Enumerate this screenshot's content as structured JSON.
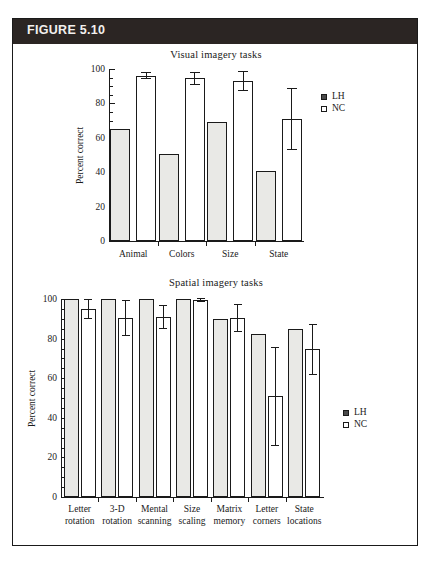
{
  "figure": {
    "label": "FIGURE 5.10",
    "header_color": "#2b2523",
    "frame_color": "#1a1a1a"
  },
  "legend": {
    "lh_label": "LH",
    "nc_label": "NC",
    "lh_swatch": "filled-square-icon",
    "nc_swatch": "open-square-icon",
    "lh_color": "#e9e9e6",
    "nc_color": "#ffffff"
  },
  "chart_data": [
    {
      "id": "visual",
      "type": "bar",
      "title": "Visual imagery tasks",
      "xlabel": "",
      "ylabel": "Percent correct",
      "ylim": [
        0,
        100
      ],
      "yticks": [
        0,
        20,
        40,
        60,
        80,
        100
      ],
      "ytick_labels": [
        "0",
        "20",
        "40",
        "60",
        "80",
        "100"
      ],
      "minor_tick_step": 5,
      "grid": false,
      "legend_position": "right",
      "categories": [
        "Animal",
        "Colors",
        "Size",
        "State"
      ],
      "series": [
        {
          "name": "LH",
          "values": [
            65,
            50.5,
            69,
            40.5
          ],
          "errors": [
            0,
            0,
            0,
            0
          ]
        },
        {
          "name": "NC",
          "values": [
            96,
            94.5,
            93,
            71
          ],
          "errors": [
            2,
            4,
            6,
            18
          ]
        }
      ]
    },
    {
      "id": "spatial",
      "type": "bar",
      "title": "Spatial imagery tasks",
      "xlabel": "",
      "ylabel": "Percent correct",
      "ylim": [
        0,
        100
      ],
      "yticks": [
        0,
        20,
        40,
        60,
        80,
        100
      ],
      "ytick_labels": [
        "0",
        "20",
        "40",
        "60",
        "80",
        "100"
      ],
      "minor_tick_step": 5,
      "grid": false,
      "legend_position": "right",
      "categories": [
        "Letter rotation",
        "3-D rotation",
        "Mental scanning",
        "Size scaling",
        "Matrix memory",
        "Letter corners",
        "State locations"
      ],
      "category_lines": [
        [
          "Letter",
          "rotation"
        ],
        [
          "3-D",
          "rotation"
        ],
        [
          "Mental",
          "scanning"
        ],
        [
          "Size",
          "scaling"
        ],
        [
          "Matrix",
          "memory"
        ],
        [
          "Letter",
          "corners"
        ],
        [
          "State",
          "locations"
        ]
      ],
      "series": [
        {
          "name": "LH",
          "values": [
            100,
            100,
            100,
            100,
            90,
            82.5,
            85
          ],
          "errors": [
            0,
            0,
            0,
            0,
            0,
            0,
            0
          ]
        },
        {
          "name": "NC",
          "values": [
            95,
            90.5,
            91,
            99.5,
            90.5,
            51,
            74.5
          ],
          "errors": [
            5,
            9,
            6,
            1,
            7,
            25,
            13
          ]
        }
      ]
    }
  ]
}
